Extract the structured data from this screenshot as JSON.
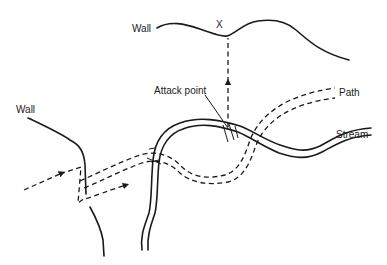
{
  "diagram": {
    "type": "navigation-sketch",
    "labels": {
      "wall_top": "Wall",
      "wall_left": "Wall",
      "target_marker": "X",
      "attack_point": "Attack point",
      "path": "Path",
      "stream": "Stream"
    },
    "elements": [
      {
        "name": "top-wall",
        "kind": "solid-line",
        "label": "Wall"
      },
      {
        "name": "left-wall",
        "kind": "solid-line",
        "label": "Wall"
      },
      {
        "name": "stream",
        "kind": "double-line",
        "label": "Stream"
      },
      {
        "name": "path",
        "kind": "double-dashed-line",
        "label": "Path"
      },
      {
        "name": "route",
        "kind": "dashed-arrow-line"
      },
      {
        "name": "bearing-to-target",
        "kind": "dashed-arrow-line",
        "target": "X"
      },
      {
        "name": "attack-point-leader",
        "kind": "leader-line",
        "label": "Attack point"
      }
    ],
    "colors": {
      "ink": "#1a1a1a",
      "background": "#ffffff"
    }
  }
}
